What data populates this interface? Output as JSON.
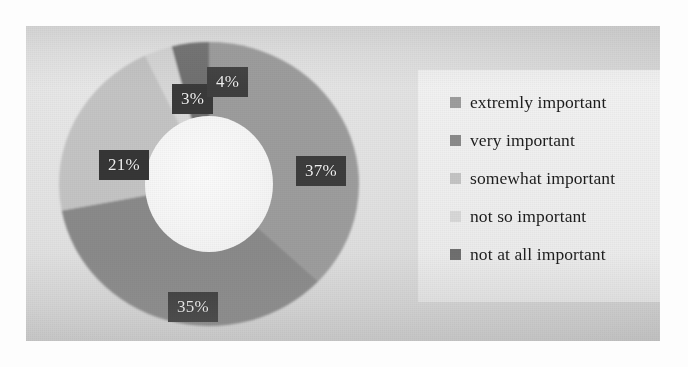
{
  "chart_data": {
    "type": "pie",
    "variant": "donut",
    "title": "",
    "subtitle": "",
    "xlabel": "",
    "ylabel": "",
    "categories": [
      "extremly important",
      "very important",
      "somewhat important",
      "not so important",
      "not at all important"
    ],
    "values": [
      37,
      35,
      21,
      3,
      4
    ],
    "value_labels": [
      "37%",
      "35%",
      "21%",
      "3%",
      "4%"
    ],
    "units": "percent",
    "total": 100,
    "start_angle_deg": 0,
    "direction": "clockwise",
    "legend_position": "right",
    "grid": false,
    "colors": [
      "#9d9d9d",
      "#8a8a8a",
      "#c4c4c4",
      "#d8d8d8",
      "#6f6f6f"
    ],
    "slices": [
      {
        "label": "extremly important",
        "value": 37,
        "display": "37%",
        "color": "#9d9d9d"
      },
      {
        "label": "very important",
        "value": 35,
        "display": "35%",
        "color": "#8a8a8a"
      },
      {
        "label": "somewhat important",
        "value": 21,
        "display": "21%",
        "color": "#c4c4c4"
      },
      {
        "label": "not so important",
        "value": 3,
        "display": "3%",
        "color": "#d8d8d8"
      },
      {
        "label": "not at all important",
        "value": 4,
        "display": "4%",
        "color": "#6f6f6f"
      }
    ]
  },
  "labels": {
    "pct_37": "37%",
    "pct_35": "35%",
    "pct_21": "21%",
    "pct_3": "3%",
    "pct_4": "4%"
  },
  "legend": {
    "items": [
      {
        "label": "extremly important",
        "color": "#9d9d9d"
      },
      {
        "label": "very important",
        "color": "#8a8a8a"
      },
      {
        "label": "somewhat important",
        "color": "#c4c4c4"
      },
      {
        "label": "not so important",
        "color": "#d8d8d8"
      },
      {
        "label": "not at all important",
        "color": "#6f6f6f"
      }
    ]
  },
  "style": {
    "label_text_color": "#f2f2f2",
    "label_box_color": "#3b3b3b",
    "plot_background": "#e3e3e3",
    "legend_background": "#efefef",
    "page_background": "#fdfdfd"
  }
}
